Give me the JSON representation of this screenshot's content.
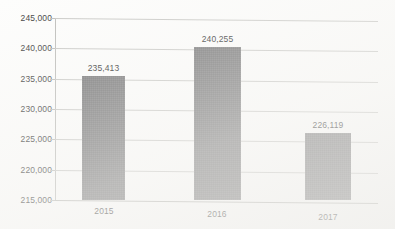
{
  "chart_data": {
    "type": "bar",
    "title": "",
    "subtitle": "",
    "xlabel": "",
    "ylabel": "",
    "categories": [
      "2015",
      "2016",
      "2017"
    ],
    "values": [
      235413,
      240255,
      226119
    ],
    "data_labels": [
      "235,413",
      "240,255",
      "226,119"
    ],
    "series": [
      {
        "name": "",
        "values": [
          235413,
          240255,
          226119
        ]
      }
    ],
    "ylim": [
      215000,
      245000
    ],
    "y_ticks": [
      215000,
      220000,
      225000,
      230000,
      235000,
      240000,
      245000
    ],
    "y_tick_labels": [
      "215,000",
      "220,000",
      "225,000",
      "230,000",
      "235,000",
      "240,000",
      "245,000"
    ],
    "grid": true,
    "grid_axis": "y",
    "legend": false,
    "legend_position": "none",
    "annotations": []
  },
  "style": {
    "bar_color": "#787879",
    "gridline_color": "#c9c9c6",
    "axis_color": "#bdbdba",
    "text_color": "#3d3d3d",
    "background_color": "#fdfdfc"
  }
}
